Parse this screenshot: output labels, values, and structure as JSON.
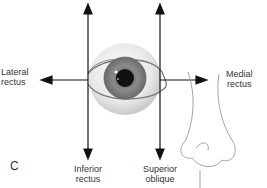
{
  "panel_label": "C",
  "labels": {
    "lateral_rectus": [
      "Lateral",
      "rectus"
    ],
    "medial_rectus": [
      "Medial",
      "rectus"
    ],
    "inferior_rectus": [
      "Inferior",
      "rectus"
    ],
    "superior_oblique": [
      "Superior",
      "oblique"
    ]
  },
  "colors": {
    "arrow": "#111111",
    "iris": "#7d7d7d",
    "pupil": "#111111",
    "sclera": "#e6e6e6",
    "outline": "#8a8a8a",
    "text": "#333333"
  }
}
